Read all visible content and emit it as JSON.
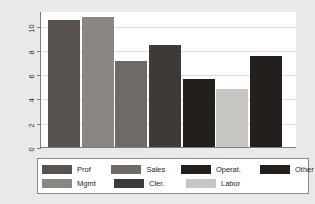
{
  "chart_data": {
    "type": "bar",
    "title": "",
    "subtitle": "",
    "xlabel": "",
    "ylabel": "mean of wage",
    "ylim": [
      0,
      11.2
    ],
    "yticks": [
      0,
      2,
      4,
      6,
      8,
      10
    ],
    "ytick_labels": [
      "0",
      "2",
      "4",
      "6",
      "8",
      "10"
    ],
    "grid": true,
    "grid_axis": "y",
    "legend_position": "bottom",
    "legend_columns": 4,
    "categories": [
      "Prof",
      "Mgmt",
      "Sales",
      "Cler.",
      "Operat.",
      "Labor",
      "Other"
    ],
    "values": [
      10.5,
      10.7,
      7.1,
      8.4,
      5.6,
      4.8,
      7.5
    ],
    "colors": [
      "#58534f",
      "#8a8782",
      "#6e6a66",
      "#3e3a37",
      "#231f1d",
      "#c7c6c3",
      "#241f1c"
    ],
    "bars": [
      {
        "label": "Prof",
        "value": 10.5,
        "color": "#58534f"
      },
      {
        "label": "Mgmt",
        "value": 10.7,
        "color": "#8a8782"
      },
      {
        "label": "Sales",
        "value": 7.1,
        "color": "#6e6a66"
      },
      {
        "label": "Cler.",
        "value": 8.4,
        "color": "#3e3a37"
      },
      {
        "label": "Operat.",
        "value": 5.6,
        "color": "#231f1d"
      },
      {
        "label": "Labor",
        "value": 4.8,
        "color": "#c7c6c3"
      },
      {
        "label": "Other",
        "value": 7.5,
        "color": "#241f1c"
      }
    ]
  },
  "axis": {
    "y_title": "mean of wage",
    "y_tick_labels": [
      "10",
      "8",
      "6",
      "4",
      "2",
      "0"
    ]
  },
  "legend": {
    "row1": [
      {
        "label": "Prof",
        "color": "#58534f"
      },
      {
        "label": "Sales",
        "color": "#6e6a66"
      },
      {
        "label": "Operat.",
        "color": "#231f1d"
      },
      {
        "label": "Other",
        "color": "#241f1c"
      }
    ],
    "row2": [
      {
        "label": "Mgmt",
        "color": "#8a8782"
      },
      {
        "label": "Cler.",
        "color": "#3e3a37"
      },
      {
        "label": "Labor",
        "color": "#c7c6c3"
      }
    ]
  },
  "figure": {
    "background": "#e9e9e9",
    "plot_background": "#ffffff",
    "axis_color": "#7b7b87",
    "grid_color": "#dcdce2"
  }
}
